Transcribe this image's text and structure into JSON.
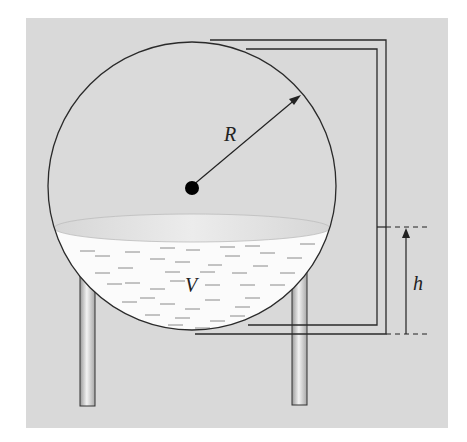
{
  "figure": {
    "type": "spherical-tank-diagram",
    "labels": {
      "radius": "R",
      "volume": "V",
      "height": "h"
    },
    "colors": {
      "panel_background": "#d9d9d9",
      "page_background": "#ffffff",
      "line": "#2a2a2a",
      "liquid": "#fbfbfb",
      "liquid_surface": "#e4e4e4",
      "dash": "#8a8a8a",
      "leg_light": "#eeeeee",
      "leg_dark": "#9a9a9a"
    }
  }
}
